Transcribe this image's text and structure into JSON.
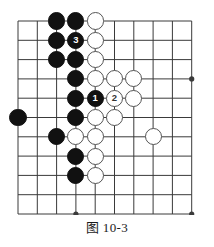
{
  "figure": {
    "caption": "图 10-3",
    "type": "go-board-diagram"
  },
  "board": {
    "cols": 10,
    "rows": 11,
    "origin_x": 18,
    "origin_y": 21,
    "spacing": 19.3,
    "line_color": "#3a3a3a",
    "line_width": 1,
    "stone_radius": 8.6,
    "black_color": "#111111",
    "white_color": "#ffffff",
    "white_border_color": "#555555",
    "star_points": [
      {
        "col": 4,
        "row": 11
      },
      {
        "col": 10,
        "row": 4
      },
      {
        "col": 10,
        "row": 11
      }
    ],
    "stones": [
      {
        "col": 3,
        "row": 1,
        "color": "black",
        "label": ""
      },
      {
        "col": 4,
        "row": 1,
        "color": "black",
        "label": ""
      },
      {
        "col": 5,
        "row": 1,
        "color": "white",
        "label": ""
      },
      {
        "col": 3,
        "row": 2,
        "color": "black",
        "label": ""
      },
      {
        "col": 4,
        "row": 2,
        "color": "black",
        "label": "3"
      },
      {
        "col": 5,
        "row": 2,
        "color": "white",
        "label": ""
      },
      {
        "col": 3,
        "row": 3,
        "color": "black",
        "label": ""
      },
      {
        "col": 4,
        "row": 3,
        "color": "black",
        "label": ""
      },
      {
        "col": 5,
        "row": 3,
        "color": "white",
        "label": ""
      },
      {
        "col": 4,
        "row": 4,
        "color": "black",
        "label": ""
      },
      {
        "col": 5,
        "row": 4,
        "color": "white",
        "label": ""
      },
      {
        "col": 6,
        "row": 4,
        "color": "white",
        "label": ""
      },
      {
        "col": 7,
        "row": 4,
        "color": "white",
        "label": ""
      },
      {
        "col": 4,
        "row": 5,
        "color": "black",
        "label": ""
      },
      {
        "col": 5,
        "row": 5,
        "color": "black",
        "label": "1"
      },
      {
        "col": 6,
        "row": 5,
        "color": "white",
        "label": "2"
      },
      {
        "col": 7,
        "row": 5,
        "color": "white",
        "label": ""
      },
      {
        "col": 1,
        "row": 6,
        "color": "black",
        "label": ""
      },
      {
        "col": 4,
        "row": 6,
        "color": "black",
        "label": ""
      },
      {
        "col": 5,
        "row": 6,
        "color": "white",
        "label": ""
      },
      {
        "col": 6,
        "row": 6,
        "color": "white",
        "label": ""
      },
      {
        "col": 3,
        "row": 7,
        "color": "black",
        "label": ""
      },
      {
        "col": 4,
        "row": 7,
        "color": "white",
        "label": ""
      },
      {
        "col": 5,
        "row": 7,
        "color": "white",
        "label": ""
      },
      {
        "col": 8,
        "row": 7,
        "color": "white",
        "label": ""
      },
      {
        "col": 4,
        "row": 8,
        "color": "black",
        "label": ""
      },
      {
        "col": 5,
        "row": 8,
        "color": "white",
        "label": ""
      },
      {
        "col": 4,
        "row": 9,
        "color": "black",
        "label": ""
      },
      {
        "col": 5,
        "row": 9,
        "color": "white",
        "label": ""
      }
    ],
    "move_sequence": [
      {
        "number": "1",
        "color": "black",
        "col": 5,
        "row": 5
      },
      {
        "number": "2",
        "color": "white",
        "col": 6,
        "row": 5
      },
      {
        "number": "3",
        "color": "black",
        "col": 4,
        "row": 2
      }
    ]
  }
}
